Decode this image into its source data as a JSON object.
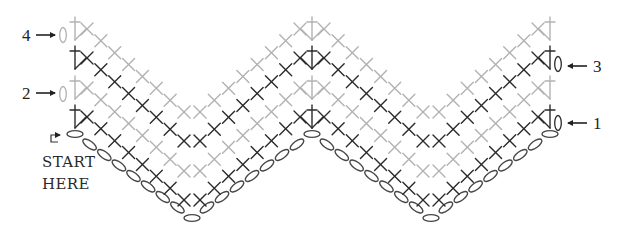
{
  "diagram": {
    "type": "crochet-stitch-chart",
    "pattern": "chevron / ripple",
    "start_label": {
      "line1": "START",
      "line2": "HERE"
    },
    "rows": [
      {
        "number": "1",
        "tone": "dark",
        "turning_chain_side": "right",
        "label_side": "right"
      },
      {
        "number": "2",
        "tone": "light",
        "turning_chain_side": "left",
        "label_side": "left"
      },
      {
        "number": "3",
        "tone": "dark",
        "turning_chain_side": "right",
        "label_side": "right"
      },
      {
        "number": "4",
        "tone": "light",
        "turning_chain_side": "left",
        "label_side": "left"
      }
    ],
    "structure": {
      "points": 2,
      "valleys": 2,
      "single_crochet_per_slope": 8,
      "slopes_per_row": 4,
      "double_crochet_positions": [
        "left-edge",
        "peak",
        "right-edge"
      ],
      "foundation_chain_count": 33
    },
    "symbols": {
      "single_crochet": "x-mark",
      "double_crochet": "t-with-crossbar",
      "chain": "oval",
      "turning_chain": "0"
    },
    "colors": {
      "dark": "#2b2b2b",
      "light": "#b2b2b2",
      "chain": "#474747",
      "text": "#222222"
    }
  }
}
